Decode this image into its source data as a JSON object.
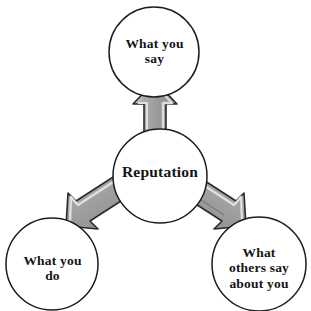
{
  "diagram": {
    "title": "Reputation",
    "type": "hub-and-spoke",
    "background_color": "#ffffff",
    "circle_stroke_color": "#1d1d1d",
    "circle_fill_color": "#ffffff",
    "text_color": "#141414",
    "arrow_fill_color": "#9c9c9c",
    "arrow_highlight_color": "#d4d4d4",
    "arrow_shadow_color": "#6f6f6f",
    "arrow_stroke_color": "#2b2b2b",
    "nodes": [
      {
        "id": "center",
        "role": "hub",
        "label": "Reputation",
        "cx": 160,
        "cy": 176,
        "r": 47
      },
      {
        "id": "top",
        "role": "spoke",
        "label": "What you\nsay",
        "cx": 154,
        "cy": 52,
        "r": 45
      },
      {
        "id": "bottom-left",
        "role": "spoke",
        "label": "What you\ndo",
        "cx": 52,
        "cy": 264,
        "r": 46
      },
      {
        "id": "bottom-right",
        "role": "spoke",
        "label": "What\nothers say\nabout you",
        "cx": 259,
        "cy": 264,
        "r": 47
      }
    ],
    "arrows": [
      {
        "id": "arrow-up",
        "from": "center",
        "to": "top",
        "direction": "up",
        "label": ""
      },
      {
        "id": "arrow-down-left",
        "from": "center",
        "to": "bottom-left",
        "direction": "down-left",
        "label": ""
      },
      {
        "id": "arrow-down-right",
        "from": "center",
        "to": "bottom-right",
        "direction": "down-right",
        "label": ""
      }
    ]
  }
}
